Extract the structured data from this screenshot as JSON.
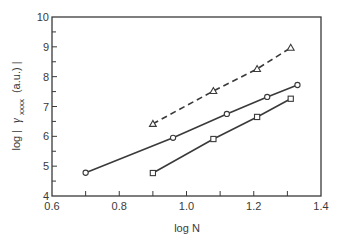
{
  "chart_data": {
    "type": "line",
    "title": "",
    "xlabel": "log  N",
    "ylabel_parts": {
      "prefix": "log  |",
      "symbol": "γ",
      "subscript": "xxxx",
      "suffix": "(a.u.) |"
    },
    "ylabel": "log | γxxxx (a.u.) |",
    "xlim": [
      0.6,
      1.4
    ],
    "ylim": [
      4,
      10
    ],
    "x_ticks": [
      0.6,
      0.8,
      1.0,
      1.2,
      1.4
    ],
    "x_tick_labels": [
      "0.6",
      "0.8",
      "1.0",
      "1.2",
      "1.4"
    ],
    "x_minor_ticks": [
      0.7,
      0.9,
      1.1,
      1.3
    ],
    "y_ticks": [
      4,
      5,
      6,
      7,
      8,
      9,
      10
    ],
    "y_tick_labels": [
      "4",
      "5",
      "6",
      "7",
      "8",
      "9",
      "10"
    ],
    "y_minor_ticks": [
      4.5,
      5.5,
      6.5,
      7.5,
      8.5,
      9.5
    ],
    "grid": false,
    "legend": null,
    "series": [
      {
        "name": "triangles",
        "marker": "triangle",
        "line_style": "dashed",
        "x": [
          0.9,
          1.08,
          1.21,
          1.31
        ],
        "y": [
          6.42,
          7.52,
          8.26,
          8.97
        ]
      },
      {
        "name": "circles",
        "marker": "circle",
        "line_style": "solid",
        "x": [
          0.7,
          0.96,
          1.12,
          1.24,
          1.33
        ],
        "y": [
          4.78,
          5.95,
          6.75,
          7.32,
          7.72
        ]
      },
      {
        "name": "squares",
        "marker": "square",
        "line_style": "solid",
        "x": [
          0.9,
          1.08,
          1.21,
          1.31
        ],
        "y": [
          4.77,
          5.91,
          6.65,
          7.26
        ]
      }
    ]
  },
  "colors": {
    "ink": "#3a3a3a",
    "background": "#ffffff"
  }
}
